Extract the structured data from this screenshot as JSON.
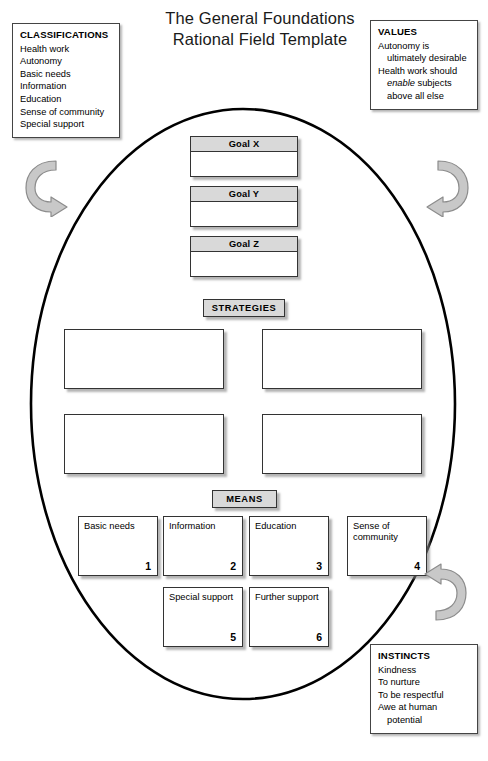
{
  "title": {
    "line1": "The General Foundations",
    "line2": "Rational Field Template"
  },
  "classifications": {
    "header": "CLASSIFICATIONS",
    "items": [
      "Health work",
      "Autonomy",
      "Basic needs",
      "Information",
      "Education",
      "Sense of community",
      "Special support"
    ]
  },
  "values": {
    "header": "VALUES",
    "line1": "Autonomy is",
    "line2": "ultimately desirable",
    "line3a": "Health work should",
    "line3b_em": "enable",
    "line3b_rest": " subjects",
    "line4": "above all else"
  },
  "instincts": {
    "header": "INSTINCTS",
    "items": [
      "Kindness",
      "To nurture",
      "To be respectful",
      "Awe at human"
    ],
    "item_cont": "potential"
  },
  "goals": [
    {
      "label": "Goal X",
      "body": ""
    },
    {
      "label": "Goal Y",
      "body": ""
    },
    {
      "label": "Goal Z",
      "body": ""
    }
  ],
  "sections": {
    "strategies_label": "STRATEGIES",
    "means_label": "MEANS"
  },
  "strategies": [
    {
      "text": ""
    },
    {
      "text": ""
    },
    {
      "text": ""
    },
    {
      "text": ""
    }
  ],
  "means": [
    {
      "label": "Basic needs",
      "number": "1"
    },
    {
      "label": "Information",
      "number": "2"
    },
    {
      "label": "Education",
      "number": "3"
    },
    {
      "label": "Sense of community",
      "number": "4"
    },
    {
      "label": "Special support",
      "number": "5"
    },
    {
      "label": "Further support",
      "number": "6"
    }
  ],
  "arrows": {
    "left": "curved-arrow-clockwise",
    "right": "curved-arrow-counterclockwise",
    "bottom": "curved-arrow-up-left"
  },
  "colors": {
    "outline": "#000000",
    "header_fill": "#d9d9d9",
    "arrow_fill": "#c0c0c0",
    "arrow_stroke": "#808080",
    "box_border": "#333333",
    "page_bg": "#ffffff"
  },
  "caption": ""
}
